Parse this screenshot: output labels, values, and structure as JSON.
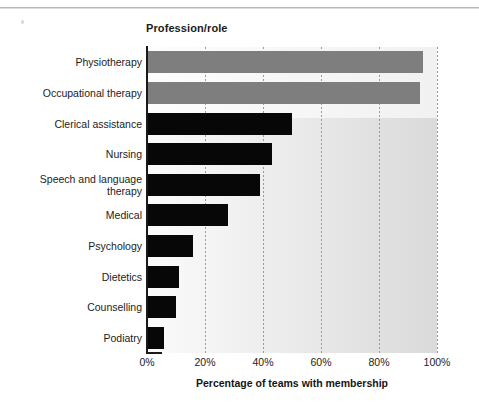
{
  "chart_data": {
    "type": "bar",
    "orientation": "horizontal",
    "title": "Profession/role",
    "xlabel": "Percentage of teams with membership",
    "ylabel": "",
    "xlim": [
      0,
      100
    ],
    "xticks": [
      "0%",
      "20%",
      "40%",
      "60%",
      "80%",
      "100%"
    ],
    "xtick_values": [
      0,
      20,
      40,
      60,
      80,
      100
    ],
    "grid": "vertical dotted gridlines at each 20% tick",
    "legend": "none",
    "categories": [
      "Physiotherapy",
      "Occupational therapy",
      "Clerical assistance",
      "Nursing",
      "Speech and language\ntherapy",
      "Medical",
      "Psychology",
      "Dietetics",
      "Counselling",
      "Podiatry"
    ],
    "values": [
      95,
      94,
      50,
      43,
      39,
      28,
      16,
      11,
      10,
      6
    ],
    "bar_colors": [
      "#7e7e7e",
      "#7e7e7e",
      "#070707",
      "#070707",
      "#070707",
      "#070707",
      "#070707",
      "#070707",
      "#070707",
      "#070707"
    ]
  },
  "colors": {
    "highlight_bar": "#7e7e7e",
    "standard_bar": "#070707",
    "axis": "#1a1a1a",
    "gridline": "#9a9a9a",
    "text": "#1c1c1c",
    "background": "#ffffff"
  }
}
